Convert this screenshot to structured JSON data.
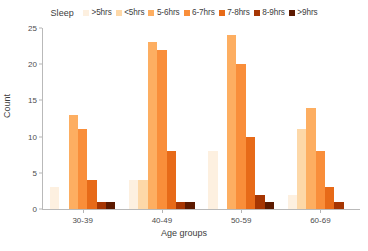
{
  "chart_data": {
    "type": "bar",
    "title": "",
    "xlabel": "Age groups",
    "ylabel": "Count",
    "categories": [
      "30-39",
      "40-49",
      "50-59",
      "60-69"
    ],
    "legend_title": "Sleep",
    "legend_position": "top",
    "grid": false,
    "ylim": [
      0,
      25
    ],
    "yticks": [
      0,
      5,
      10,
      15,
      20,
      25
    ],
    "series": [
      {
        "name": ">5hrs",
        "color": "#fdf0e0",
        "values": [
          3,
          4,
          8,
          2
        ]
      },
      {
        "name": "<5hrs",
        "color": "#fdd8a8",
        "values": [
          0,
          4,
          0,
          11
        ]
      },
      {
        "name": "5-6hrs",
        "color": "#fdae61",
        "values": [
          13,
          23,
          24,
          14
        ]
      },
      {
        "name": "6-7hrs",
        "color": "#f98e3a",
        "values": [
          11,
          22,
          20,
          8
        ]
      },
      {
        "name": "7-8hrs",
        "color": "#e76a18",
        "values": [
          4,
          8,
          10,
          3
        ]
      },
      {
        "name": "8-9hrs",
        "color": "#a63603",
        "values": [
          1,
          1,
          2,
          1
        ]
      },
      {
        "name": ">9hrs",
        "color": "#5c1a00",
        "values": [
          1,
          1,
          1,
          0
        ]
      }
    ]
  }
}
